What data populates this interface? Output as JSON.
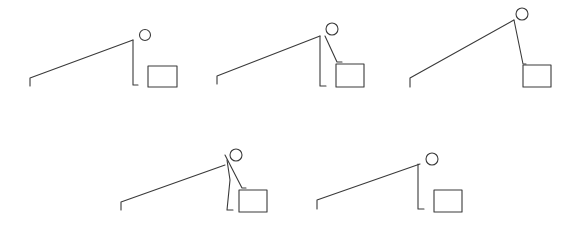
{
  "diagram": {
    "stroke_color": "#3a3a3a",
    "background": "#ffffff",
    "figures": [
      {
        "id": 1,
        "pole": [
          30,
          86,
          30,
          78,
          133,
          40
        ],
        "head": [
          145,
          35,
          5.5
        ],
        "body": [
          133,
          40,
          133,
          85,
          138,
          85
        ],
        "arm": null,
        "box": [
          148,
          66,
          29,
          21
        ]
      },
      {
        "id": 2,
        "pole": [
          217,
          84,
          217,
          76,
          320,
          36
        ],
        "head": [
          332,
          29,
          6
        ],
        "body": [
          320,
          36,
          320,
          86,
          326,
          86
        ],
        "arm": [
          325,
          36,
          337,
          62,
          342,
          62
        ],
        "box": [
          336,
          64,
          28,
          23
        ]
      },
      {
        "id": 3,
        "pole": [
          410,
          87,
          410,
          78,
          514,
          20
        ],
        "head": [
          522,
          14,
          6
        ],
        "body": null,
        "arm": [
          514,
          20,
          523,
          64,
          526,
          64
        ],
        "box": [
          523,
          65,
          28,
          22
        ]
      },
      {
        "id": 4,
        "pole": [
          121,
          210,
          121,
          202,
          225,
          165
        ],
        "head": [
          236,
          155,
          6
        ],
        "body": [
          227,
          160,
          230,
          180,
          227,
          210,
          233,
          210
        ],
        "arm": [
          225,
          155,
          242,
          188,
          246,
          188
        ],
        "box": [
          239,
          190,
          28,
          22
        ]
      },
      {
        "id": 5,
        "pole": [
          317,
          209,
          317,
          200,
          420,
          164
        ],
        "head": [
          432,
          159,
          6
        ],
        "body": [
          418,
          164,
          418,
          209,
          424,
          209
        ],
        "arm": null,
        "box": [
          434,
          190,
          28,
          22
        ]
      }
    ]
  }
}
